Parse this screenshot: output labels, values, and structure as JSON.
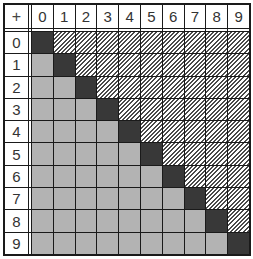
{
  "table": {
    "corner_symbol": "+",
    "column_headers": [
      "0",
      "1",
      "2",
      "3",
      "4",
      "5",
      "6",
      "7",
      "8",
      "9"
    ],
    "row_headers": [
      "0",
      "1",
      "2",
      "3",
      "4",
      "5",
      "6",
      "7",
      "8",
      "9"
    ],
    "cell_styles": {
      "diagonal": "dark",
      "below_diagonal": "gray",
      "above_diagonal": "hatched"
    },
    "colors": {
      "dark": "#383838",
      "gray": "#b3b3b3",
      "hatch": "#4a4a4a",
      "border": "#1a1a1a",
      "header_bg": "#ffffff"
    }
  }
}
